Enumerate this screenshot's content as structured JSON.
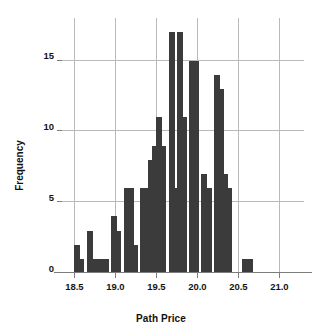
{
  "chart_data": {
    "type": "bar",
    "title": "",
    "subtitle": "",
    "xlabel": "Path Price",
    "ylabel": "Frequency",
    "xlim": [
      18.35,
      21.3
    ],
    "ylim": [
      0,
      18
    ],
    "grid": true,
    "legend": null,
    "bin_width": 0.05,
    "xticks": [
      {
        "value": 18.5,
        "label": "18.5"
      },
      {
        "value": 19.0,
        "label": "19.0"
      },
      {
        "value": 19.5,
        "label": "19.5"
      },
      {
        "value": 20.0,
        "label": "20.0"
      },
      {
        "value": 20.5,
        "label": "20.5"
      },
      {
        "value": 21.0,
        "label": "21.0"
      }
    ],
    "yticks": [
      {
        "value": 0,
        "label": "0"
      },
      {
        "value": 5,
        "label": "5"
      },
      {
        "value": 10,
        "label": "10"
      },
      {
        "value": 15,
        "label": "15"
      }
    ],
    "bin_left_edges": [
      18.5,
      18.55,
      18.6,
      18.65,
      18.7,
      18.75,
      18.8,
      18.85,
      18.9,
      18.95,
      19.0,
      19.05,
      19.1,
      19.15,
      19.2,
      19.25,
      19.3,
      19.35,
      19.4,
      19.45,
      19.5,
      19.55,
      19.6,
      19.65,
      19.7,
      19.75,
      19.8,
      19.85,
      19.9,
      19.95,
      20.0,
      20.05,
      20.1,
      20.15,
      20.2,
      20.25,
      20.3,
      20.35,
      20.4,
      20.45,
      20.5,
      20.55,
      20.6,
      20.65,
      20.7,
      20.75,
      20.8,
      20.85,
      20.9,
      20.95,
      21.0,
      21.05,
      21.1,
      21.15
    ],
    "categories": [
      "18.50",
      "18.55",
      "18.60",
      "18.65",
      "18.70",
      "18.75",
      "18.80",
      "18.85",
      "18.90",
      "18.95",
      "19.00",
      "19.05",
      "19.10",
      "19.15",
      "19.20",
      "19.25",
      "19.30",
      "19.35",
      "19.40",
      "19.45",
      "19.50",
      "19.55",
      "19.60",
      "19.65",
      "19.70",
      "19.75",
      "19.80",
      "19.85",
      "19.90",
      "19.95",
      "20.00",
      "20.05",
      "20.10",
      "20.15",
      "20.20",
      "20.25",
      "20.30",
      "20.35",
      "20.40",
      "20.45",
      "20.50",
      "20.55",
      "20.60",
      "20.65",
      "20.70",
      "20.75",
      "20.80",
      "20.85",
      "20.90",
      "20.95",
      "21.00",
      "21.05",
      "21.10",
      "21.15"
    ],
    "values": [
      2,
      1,
      0,
      3,
      1,
      1,
      1,
      1,
      0,
      0,
      4,
      3,
      0,
      6,
      6,
      2,
      0,
      6,
      6,
      8,
      9,
      11,
      9,
      17,
      6,
      17,
      11,
      15,
      15,
      7,
      6,
      6,
      14,
      13,
      7,
      6,
      0,
      0,
      1,
      1,
      0,
      0,
      0,
      0,
      0,
      0,
      0,
      0,
      0,
      0,
      0,
      0,
      0,
      0
    ],
    "bars": [
      {
        "x": 18.5,
        "h": 2
      },
      {
        "x": 18.55,
        "h": 1
      },
      {
        "x": 18.65,
        "h": 3
      },
      {
        "x": 18.7,
        "h": 1
      },
      {
        "x": 18.75,
        "h": 1
      },
      {
        "x": 18.8,
        "h": 1
      },
      {
        "x": 18.85,
        "h": 1
      },
      {
        "x": 18.95,
        "h": 4
      },
      {
        "x": 19.0,
        "h": 3
      },
      {
        "x": 19.1,
        "h": 6
      },
      {
        "x": 19.15,
        "h": 6
      },
      {
        "x": 19.2,
        "h": 2
      },
      {
        "x": 19.3,
        "h": 6
      },
      {
        "x": 19.35,
        "h": 6
      },
      {
        "x": 19.4,
        "h": 8
      },
      {
        "x": 19.45,
        "h": 9
      },
      {
        "x": 19.5,
        "h": 11
      },
      {
        "x": 19.55,
        "h": 9
      },
      {
        "x": 19.65,
        "h": 17
      },
      {
        "x": 19.7,
        "h": 6
      },
      {
        "x": 19.75,
        "h": 17
      },
      {
        "x": 19.8,
        "h": 11
      },
      {
        "x": 19.9,
        "h": 15
      },
      {
        "x": 19.95,
        "h": 15
      },
      {
        "x": 20.05,
        "h": 7
      },
      {
        "x": 20.1,
        "h": 6
      },
      {
        "x": 20.2,
        "h": 14
      },
      {
        "x": 20.25,
        "h": 13
      },
      {
        "x": 20.3,
        "h": 7
      },
      {
        "x": 20.35,
        "h": 6
      },
      {
        "x": 20.55,
        "h": 1
      },
      {
        "x": 20.6,
        "h": 1
      }
    ],
    "bar_color": "#3b3b3b",
    "grid_color": "#b9b9b9",
    "axis_color": "#7d7d7d",
    "background": "#ffffff",
    "max_frequency": 17,
    "n_bars": 32
  }
}
